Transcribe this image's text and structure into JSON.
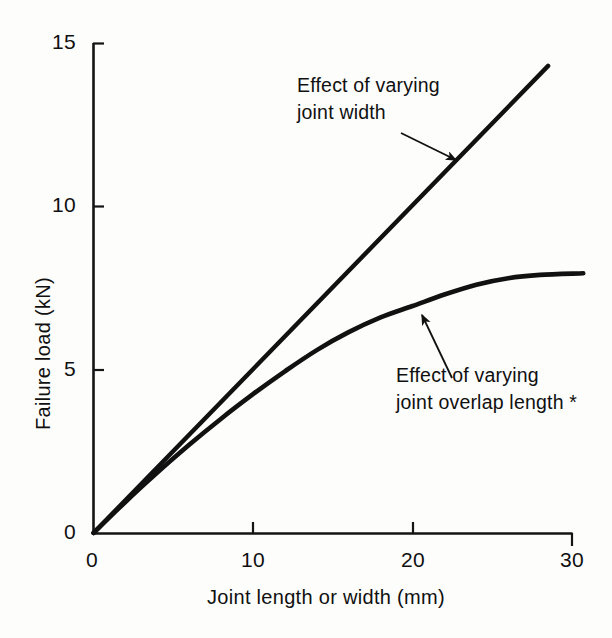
{
  "chart_data": {
    "type": "line",
    "title": "",
    "xlabel": "Joint length or width (mm)",
    "ylabel": "Failure load (kN)",
    "xlim": [
      0,
      30
    ],
    "ylim": [
      0,
      15
    ],
    "xticks": [
      "0",
      "10",
      "20",
      "30"
    ],
    "xtick_values": [
      0,
      10,
      20,
      30
    ],
    "yticks": [
      "0",
      "5",
      "10",
      "15"
    ],
    "ytick_values": [
      0,
      5,
      10,
      15
    ],
    "grid": false,
    "legend_position": "inline-annotations",
    "line_color": "#111111",
    "background_color": "#fdfdfc",
    "series": [
      {
        "name": "Effect of varying joint width",
        "shape": "straight-proportional",
        "x": [
          0,
          2,
          4,
          6,
          8,
          10,
          12,
          14,
          16,
          18,
          20,
          22,
          24,
          26,
          28.5
        ],
        "values": [
          0,
          1.0,
          2.0,
          3.0,
          4.0,
          5.0,
          6.0,
          7.0,
          8.0,
          9.0,
          10.0,
          11.0,
          12.0,
          13.0,
          14.3
        ]
      },
      {
        "name": "Effect of varying joint overlap length *",
        "shape": "saturating-curve",
        "x": [
          0,
          2,
          4,
          6,
          8,
          10,
          12,
          14,
          16,
          18,
          20,
          22,
          24,
          26,
          28,
          30.7
        ],
        "values": [
          0,
          0.95,
          1.85,
          2.7,
          3.5,
          4.25,
          4.95,
          5.6,
          6.15,
          6.6,
          6.95,
          7.3,
          7.6,
          7.8,
          7.9,
          7.95
        ]
      }
    ],
    "annotations": [
      {
        "id": "annotation-joint-width",
        "line1": "Effect of varying",
        "line2": "joint width",
        "points_to_series": "Effect of varying joint width",
        "arrow_direction": "down-right"
      },
      {
        "id": "annotation-joint-overlap",
        "line1": "Effect of varying",
        "line2": "joint overlap length *",
        "points_to_series": "Effect of varying joint overlap length *",
        "arrow_direction": "up-left"
      }
    ]
  },
  "axes": {
    "x_title": "Joint length or width (mm)",
    "y_title": "Failure load (kN)",
    "x_tick_labels": [
      "0",
      "10",
      "20",
      "30"
    ],
    "y_tick_labels": [
      "0",
      "5",
      "10",
      "15"
    ]
  },
  "annotations": {
    "top": {
      "line1": "Effect of varying",
      "line2": "joint width"
    },
    "bottom": {
      "line1": "Effect of varying",
      "line2": "joint overlap length *"
    }
  }
}
